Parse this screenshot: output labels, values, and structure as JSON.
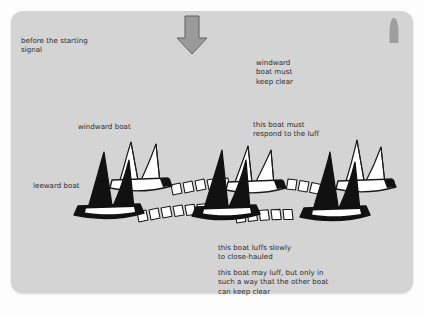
{
  "diagram": {
    "panel": {
      "background_color": "#d4d4d4",
      "page_background_color": "#fdfdfd"
    },
    "captions": {
      "before_start": "before the starting\nsignal",
      "windward_keep_clear": "windward\nboat must\nkeep clear",
      "windward_boat": "windward boat",
      "respond_to_luff": "this boat must\nrespond to the luff",
      "leeward_boat": "leeward boat",
      "luffs_slowly": "this boat luffs slowly\nto close-hauled",
      "may_luff": "this boat may luff, but only in\nsuch a way that the other boat\ncan keep clear"
    },
    "wind_arrow": {
      "name": "wind-direction-arrow",
      "direction": "down",
      "fill_color": "#9a9a9a",
      "stroke_color": "#5d5d5d"
    },
    "mark_buoy": {
      "name": "committee-mark-buoy",
      "fill_color": "#9e9e9e"
    },
    "boats": [
      {
        "id": "leeward-1",
        "role": "leeward boat",
        "color": "black",
        "label": "leeward boat"
      },
      {
        "id": "windward-1",
        "role": "windward boat",
        "color": "white",
        "label": "windward boat"
      },
      {
        "id": "leeward-2",
        "role": "leeward boat",
        "color": "black",
        "label": ""
      },
      {
        "id": "windward-2",
        "role": "windward boat",
        "color": "white",
        "label": ""
      },
      {
        "id": "leeward-3",
        "role": "leeward boat",
        "color": "black",
        "label": ""
      },
      {
        "id": "windward-3",
        "role": "windward boat",
        "color": "white",
        "label": ""
      }
    ],
    "wake_trails": {
      "name": "wake-dash-trail",
      "dash_fill": "#ffffff",
      "dash_stroke": "#1a1a1a"
    },
    "colors": {
      "hull_black": "#111111",
      "sail_white": "#ffffff",
      "outline": "#1a1a1a",
      "text": "#2b2b2b"
    }
  }
}
